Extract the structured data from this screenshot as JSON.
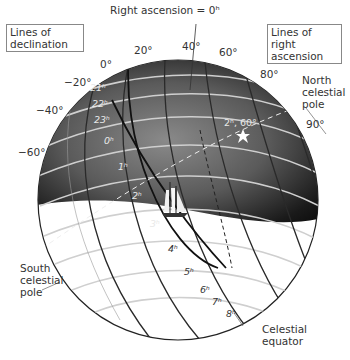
{
  "diagram": {
    "type": "celestial-sphere",
    "legend": {
      "declination_box": "Lines of declination",
      "ra_box_line1": "Lines of right",
      "ra_box_line2": "ascension"
    },
    "labels": {
      "ra_zero": "Right ascension = 0ʰ",
      "north_pole_1": "North",
      "north_pole_2": "celestial",
      "north_pole_3": "pole",
      "south_pole_1": "South",
      "south_pole_2": "celestial",
      "south_pole_3": "pole",
      "equator_1": "Celestial",
      "equator_2": "equator",
      "star": "2ʰ, 60°"
    },
    "declination_ticks": {
      "d0": "0°",
      "d20": "20°",
      "d40": "40°",
      "d60": "60°",
      "d80": "80°",
      "d90": "90°",
      "dm20": "−20°",
      "dm40": "−40°",
      "dm60": "−60°"
    },
    "ra_ticks": {
      "h21": "21ʰ",
      "h22": "22ʰ",
      "h23": "23ʰ",
      "h0": "0ʰ",
      "h1": "1ʰ",
      "h2": "2ʰ",
      "h3": "3ʰ",
      "h4": "4ʰ",
      "h5": "5ʰ",
      "h6": "6ʰ",
      "h7": "7ʰ",
      "h8": "8ʰ"
    },
    "colors": {
      "sky_dark": "#111111",
      "sky_mid": "#6a6a6a",
      "lower_sphere": "#ffffff",
      "grid_light": "#cfcfcf",
      "grid_dark": "#333333",
      "equator_line": "#111111"
    }
  }
}
